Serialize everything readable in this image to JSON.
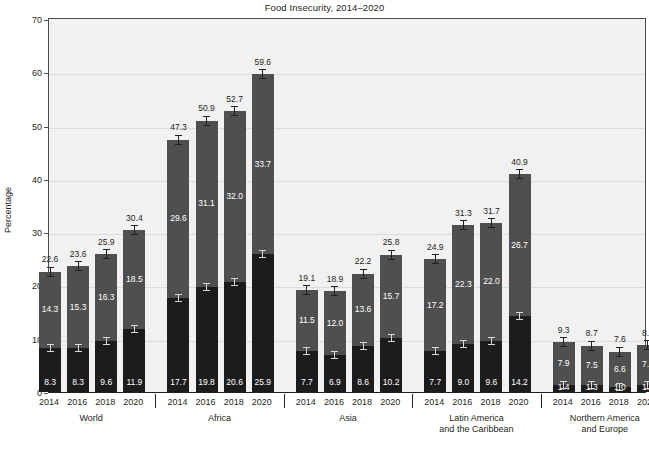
{
  "chart_data": {
    "type": "bar",
    "title": "Food Insecurity, 2014–2020",
    "xlabel": "",
    "ylabel": "Percentage",
    "ylim": [
      0,
      70
    ],
    "ytick_step": 10,
    "yticks": [
      "0",
      "10",
      "20",
      "30",
      "40",
      "50",
      "60",
      "70"
    ],
    "grid": true,
    "stacked": true,
    "legend_position": "top-right",
    "legend": [
      {
        "name": "Moderate food insecurity",
        "color": "#4f4f4f",
        "key": "moderate"
      },
      {
        "name": "Severe food insecurity",
        "color": "#1c1c1c",
        "key": "severe"
      }
    ],
    "categories": [
      "2014",
      "2016",
      "2018",
      "2020"
    ],
    "groups": [
      {
        "name": "World",
        "label_lines": [
          "World"
        ],
        "bars": [
          {
            "year": "2014",
            "total": 22.6,
            "moderate": 14.3,
            "severe": 8.3
          },
          {
            "year": "2016",
            "total": 23.6,
            "moderate": 15.3,
            "severe": 8.3
          },
          {
            "year": "2018",
            "total": 25.9,
            "moderate": 16.3,
            "severe": 9.6
          },
          {
            "year": "2020",
            "total": 30.4,
            "moderate": 18.5,
            "severe": 11.9
          }
        ]
      },
      {
        "name": "Africa",
        "label_lines": [
          "Africa"
        ],
        "bars": [
          {
            "year": "2014",
            "total": 47.3,
            "moderate": 29.6,
            "severe": 17.7
          },
          {
            "year": "2016",
            "total": 50.9,
            "moderate": 31.1,
            "severe": 19.8
          },
          {
            "year": "2018",
            "total": 52.7,
            "moderate": 32.0,
            "severe": 20.6
          },
          {
            "year": "2020",
            "total": 59.6,
            "moderate": 33.7,
            "severe": 25.9
          }
        ]
      },
      {
        "name": "Asia",
        "label_lines": [
          "Asia"
        ],
        "bars": [
          {
            "year": "2014",
            "total": 19.1,
            "moderate": 11.5,
            "severe": 7.7
          },
          {
            "year": "2016",
            "total": 18.9,
            "moderate": 12.0,
            "severe": 6.9
          },
          {
            "year": "2018",
            "total": 22.2,
            "moderate": 13.6,
            "severe": 8.6
          },
          {
            "year": "2020",
            "total": 25.8,
            "moderate": 15.7,
            "severe": 10.2
          }
        ]
      },
      {
        "name": "Latin America and the Caribbean",
        "label_lines": [
          "Latin America",
          "and the Caribbean"
        ],
        "bars": [
          {
            "year": "2014",
            "total": 24.9,
            "moderate": 17.2,
            "severe": 7.7
          },
          {
            "year": "2016",
            "total": 31.3,
            "moderate": 22.3,
            "severe": 9.0
          },
          {
            "year": "2018",
            "total": 31.7,
            "moderate": 22.0,
            "severe": 9.6
          },
          {
            "year": "2020",
            "total": 40.9,
            "moderate": 26.7,
            "severe": 14.2
          }
        ]
      },
      {
        "name": "Northern America and Europe",
        "label_lines": [
          "Northern America",
          "and Europe"
        ],
        "bars": [
          {
            "year": "2014",
            "total": 9.3,
            "moderate": 7.9,
            "severe": 1.4
          },
          {
            "year": "2016",
            "total": 8.7,
            "moderate": 7.5,
            "severe": 1.3
          },
          {
            "year": "2018",
            "total": 7.6,
            "moderate": 6.6,
            "severe": 1.0
          },
          {
            "year": "2020",
            "total": 8.8,
            "moderate": 7.4,
            "severe": 1.4
          }
        ]
      }
    ]
  },
  "colors": {
    "moderate": "#4f4f4f",
    "severe": "#1c1c1c",
    "plot_background": "#f1f1f1",
    "gridline": "#dcdcdc",
    "text": "#231f20"
  }
}
